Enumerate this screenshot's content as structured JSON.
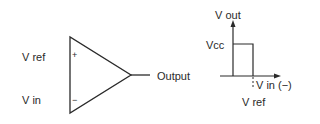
{
  "comparator": {
    "input_plus_label": "V ref",
    "input_minus_label": "V in",
    "plus_sign": "+",
    "minus_sign": "−",
    "output_label": "Output"
  },
  "graph": {
    "y_axis_label": "V out",
    "level_label": "Vcc",
    "x_axis_label": "V in (−)",
    "threshold_label": "V ref"
  },
  "colors": {
    "stroke": "#2a2a2a",
    "background": "#ffffff"
  }
}
